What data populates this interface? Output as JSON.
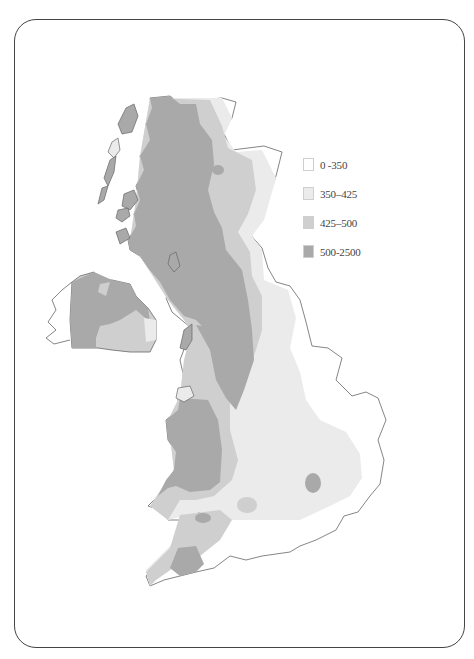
{
  "map": {
    "subject": "Rainfall distribution across the British Isles",
    "colors": {
      "outline": "#666666",
      "class_0_350": "#ffffff",
      "class_350_425": "#ebebeb",
      "class_425_500": "#cfcfcf",
      "class_500_2500": "#a9a9a9"
    }
  },
  "legend": {
    "items": [
      {
        "label": "0   -350",
        "color": "#ffffff"
      },
      {
        "label": "350–425",
        "color": "#ebebeb"
      },
      {
        "label": "425–500",
        "color": "#cfcfcf"
      },
      {
        "label": "500-2500",
        "color": "#a9a9a9"
      }
    ]
  }
}
